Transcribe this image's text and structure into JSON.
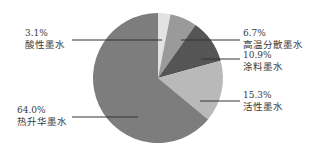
{
  "chart_data": {
    "type": "pie",
    "title": "",
    "start_angle": "12 o'clock",
    "direction": "clockwise",
    "slices": [
      {
        "label": "酸性墨水",
        "value": 3.1,
        "pct_label": "3.1%",
        "color": "#e2e2e2"
      },
      {
        "label": "高温分散墨水",
        "value": 6.7,
        "pct_label": "6.7%",
        "color": "#9a9a9a"
      },
      {
        "label": "涂料墨水",
        "value": 10.9,
        "pct_label": "10.9%",
        "color": "#555555"
      },
      {
        "label": "活性墨水",
        "value": 15.3,
        "pct_label": "15.3%",
        "color": "#b9b9b9"
      },
      {
        "label": "热升华墨水",
        "value": 64.0,
        "pct_label": "64.0%",
        "color": "#7d7d7d"
      }
    ],
    "categories": [
      "酸性墨水",
      "高温分散墨水",
      "涂料墨水",
      "活性墨水",
      "热升华墨水"
    ],
    "values": [
      3.1,
      6.7,
      10.9,
      15.3,
      64.0
    ],
    "legend": "none (leader-line labels)"
  },
  "labels": {
    "acid": {
      "pct": "3.1%",
      "name": "酸性墨水"
    },
    "disperse": {
      "pct": "6.7%",
      "name": "高温分散墨水"
    },
    "pigment": {
      "pct": "10.9%",
      "name": "涂料墨水"
    },
    "reactive": {
      "pct": "15.3%",
      "name": "活性墨水"
    },
    "sublimation": {
      "pct": "64.0%",
      "name": "热升华墨水"
    }
  }
}
